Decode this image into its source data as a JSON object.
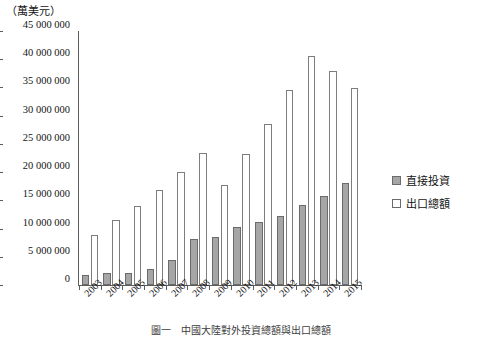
{
  "unit_label": "（萬美元）",
  "caption": "圖一　中國大陸對外投資總額與出口總額",
  "legend": {
    "position": "right",
    "items": [
      {
        "label": "直接投資",
        "key": "fdi",
        "color": "#a6a6a6"
      },
      {
        "label": "出口總額",
        "key": "exp",
        "color": "#ffffff"
      }
    ]
  },
  "chart_data": {
    "type": "bar",
    "title": "",
    "xlabel": "",
    "ylabel": "（萬美元）",
    "ylim": [
      0,
      45000000
    ],
    "ytick_labels": [
      "45 000 000",
      "40 000 000",
      "35 000 000",
      "30 000 000",
      "25 000 000",
      "20 000 000",
      "15 000 000",
      "10 000 000",
      "5 000 000",
      "0"
    ],
    "ytick_values": [
      45000000,
      40000000,
      35000000,
      30000000,
      25000000,
      20000000,
      15000000,
      10000000,
      5000000,
      0
    ],
    "grid": false,
    "categories": [
      "2003",
      "2004",
      "2005",
      "2006",
      "2007",
      "2008",
      "2009",
      "2010",
      "2011",
      "2012",
      "2013",
      "2014",
      "2015"
    ],
    "series": [
      {
        "name": "直接投資",
        "values": [
          1700000,
          2200000,
          2200000,
          2900000,
          4400000,
          8200000,
          8500000,
          10300000,
          11100000,
          12200000,
          14200000,
          15800000,
          18000000
        ]
      },
      {
        "name": "出口總額",
        "values": [
          8800000,
          11500000,
          14000000,
          16900000,
          20100000,
          23400000,
          17800000,
          23300000,
          28600000,
          34500000,
          40500000,
          38000000,
          34900000
        ]
      }
    ]
  }
}
